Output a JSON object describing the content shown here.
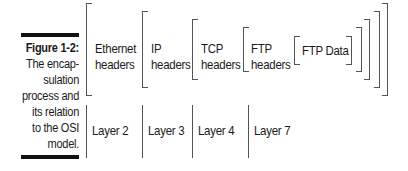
{
  "figure": {
    "number": "Figure 1-2:",
    "caption_lines": [
      "The encap-",
      "sulation",
      "process and",
      "its relation",
      "to the OSI",
      "model."
    ]
  },
  "headers": [
    {
      "line1": "Ethernet",
      "line2": "headers"
    },
    {
      "line1": "IP",
      "line2": "headers"
    },
    {
      "line1": "TCP",
      "line2": "headers"
    },
    {
      "line1": "FTP",
      "line2": "headers"
    }
  ],
  "payload": "FTP Data",
  "layers": [
    "Layer 2",
    "Layer 3",
    "Layer 4",
    "Layer 7"
  ]
}
